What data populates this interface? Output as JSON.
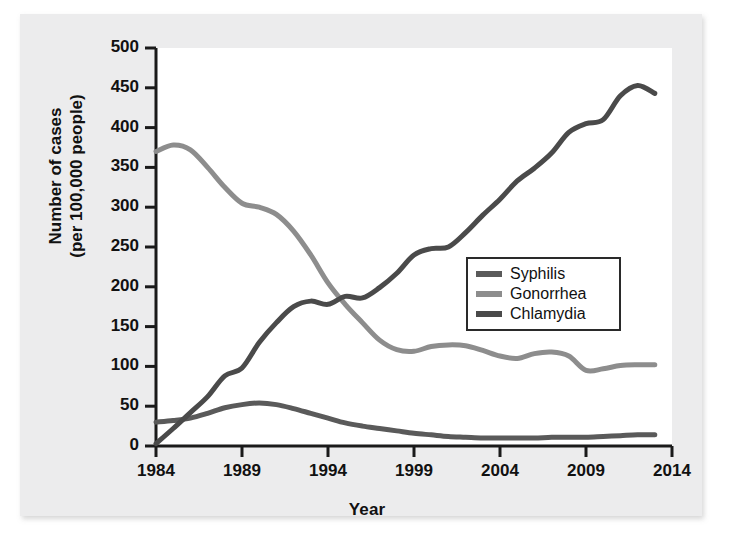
{
  "chart_data": {
    "type": "line",
    "title": "",
    "xlabel": "Year",
    "ylabel_line1": "Number of cases",
    "ylabel_line2": "(per 100,000 people)",
    "xlim": [
      1984,
      2014
    ],
    "ylim": [
      0,
      500
    ],
    "xticks": [
      1984,
      1989,
      1994,
      1999,
      2004,
      2009,
      2014
    ],
    "yticks": [
      0,
      50,
      100,
      150,
      200,
      250,
      300,
      350,
      400,
      450,
      500
    ],
    "grid": false,
    "legend_position": "center-right",
    "x": [
      1984,
      1985,
      1986,
      1987,
      1988,
      1989,
      1990,
      1991,
      1992,
      1993,
      1994,
      1995,
      1996,
      1997,
      1998,
      1999,
      2000,
      2001,
      2002,
      2003,
      2004,
      2005,
      2006,
      2007,
      2008,
      2009,
      2010,
      2011,
      2012,
      2013
    ],
    "series": [
      {
        "name": "Syphilis",
        "color": "#5a5a5a",
        "values": [
          30,
          32,
          35,
          41,
          48,
          52,
          54,
          52,
          47,
          41,
          35,
          29,
          25,
          22,
          19,
          16,
          14,
          12,
          11,
          10,
          10,
          10,
          10,
          11,
          11,
          11,
          12,
          13,
          14,
          14
        ]
      },
      {
        "name": "Gonorrhea",
        "color": "#8d8d8d",
        "values": [
          370,
          378,
          372,
          350,
          325,
          305,
          300,
          291,
          270,
          240,
          205,
          178,
          155,
          133,
          121,
          119,
          125,
          127,
          126,
          120,
          113,
          110,
          116,
          118,
          113,
          95,
          97,
          101,
          102,
          102
        ]
      },
      {
        "name": "Chlamydia",
        "color": "#4a4a4a",
        "values": [
          3,
          22,
          42,
          62,
          88,
          98,
          130,
          155,
          175,
          182,
          178,
          188,
          186,
          199,
          217,
          240,
          248,
          250,
          268,
          290,
          310,
          333,
          349,
          368,
          394,
          405,
          410,
          440,
          453,
          443
        ]
      }
    ]
  },
  "legend": {
    "entries": [
      {
        "label": "Syphilis"
      },
      {
        "label": "Gonorrhea"
      },
      {
        "label": "Chlamydia"
      }
    ]
  },
  "axes": {
    "x_title": "Year",
    "y_title_line1": "Number of cases",
    "y_title_line2": "(per 100,000 people)",
    "x_tick_labels": [
      "1984",
      "1989",
      "1994",
      "1999",
      "2004",
      "2009",
      "2014"
    ],
    "y_tick_labels": [
      "0",
      "50",
      "100",
      "150",
      "200",
      "250",
      "300",
      "350",
      "400",
      "450",
      "500"
    ]
  },
  "colors": {
    "axis": "#1a1a1a",
    "plot_background": "#ffffff",
    "page_background": "#ececed",
    "syphilis": "#5a5a5a",
    "gonorrhea": "#8d8d8d",
    "chlamydia": "#4a4a4a"
  }
}
